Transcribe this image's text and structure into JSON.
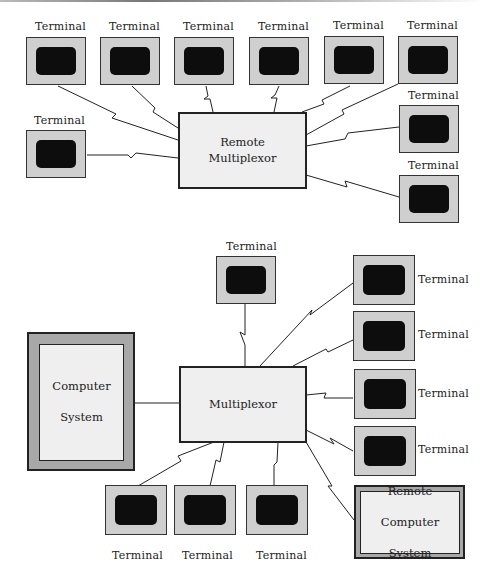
{
  "diagrams": {
    "top": {
      "hub": {
        "line1": "Remote",
        "line2": "Multiplexor"
      },
      "terminals": [
        {
          "label": "Terminal"
        },
        {
          "label": "Terminal"
        },
        {
          "label": "Terminal"
        },
        {
          "label": "Terminal"
        },
        {
          "label": "Terminal"
        },
        {
          "label": "Terminal"
        },
        {
          "label": "Terminal"
        },
        {
          "label": "Terminal"
        },
        {
          "label": "Terminal"
        }
      ]
    },
    "bottom": {
      "hub": {
        "label": "Multiplexor"
      },
      "computer_system": {
        "line1": "Computer",
        "line2": "System"
      },
      "remote_computer_system": {
        "line1": "Remote",
        "line2": "Computer",
        "line3": "System"
      },
      "terminals": [
        {
          "label": "Terminal"
        },
        {
          "label": "Terminal"
        },
        {
          "label": "Terminal"
        },
        {
          "label": "Terminal"
        },
        {
          "label": "Terminal"
        },
        {
          "label": "Terminal"
        },
        {
          "label": "Terminal"
        },
        {
          "label": "Terminal"
        }
      ]
    }
  },
  "colors": {
    "terminal_bezel": "#cfcfcf",
    "terminal_screen": "#0d0d0d",
    "box_fill": "#efefef",
    "system_frame": "#a8a8a8",
    "line": "#222222"
  }
}
